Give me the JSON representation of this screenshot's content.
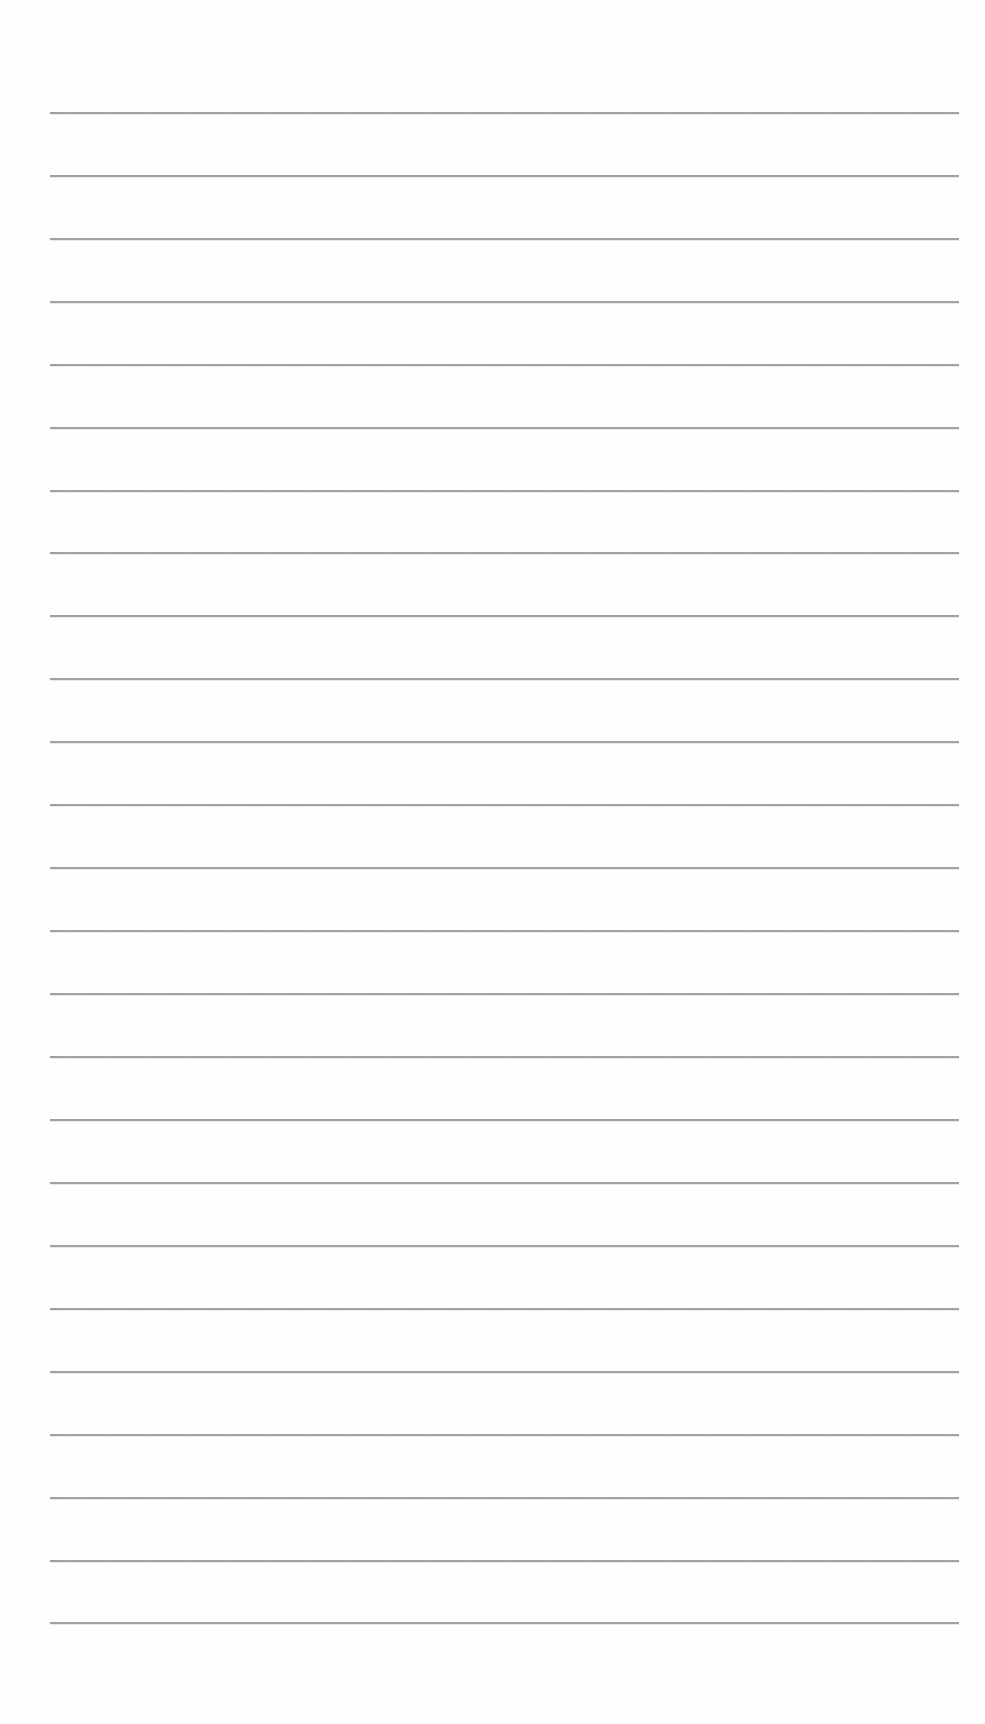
{
  "page": {
    "type": "blank ruled sheet",
    "background_color": "#fefefe",
    "line_color": "#8f8f8f",
    "line_left": 50,
    "line_right": 959,
    "line_count": 25,
    "line_positions_y": [
      113,
      176,
      239,
      302,
      365,
      428,
      491,
      553,
      616,
      679,
      742,
      805,
      868,
      931,
      994,
      1057,
      1120,
      1183,
      1246,
      1309,
      1372,
      1435,
      1498,
      1561,
      1623
    ]
  }
}
